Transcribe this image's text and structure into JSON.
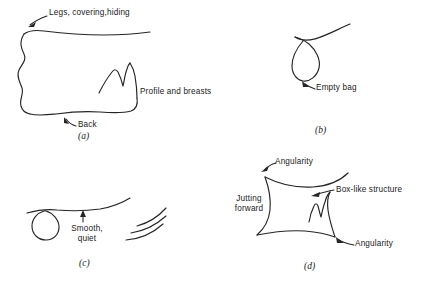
{
  "figure": {
    "background_color": "#ffffff",
    "ink_color": "#262626",
    "panels": [
      {
        "id": "a",
        "label": "(a)",
        "annotations": [
          {
            "name": "legs-covering-hiding",
            "text": "Legs, covering,hiding"
          },
          {
            "name": "profile-and-breasts",
            "text": "Profile and breasts"
          },
          {
            "name": "back",
            "text": "Back"
          }
        ]
      },
      {
        "id": "b",
        "label": "(b)",
        "annotations": [
          {
            "name": "empty-bag",
            "text": "Empty bag"
          }
        ]
      },
      {
        "id": "c",
        "label": "(c)",
        "annotations": [
          {
            "name": "smooth-quiet",
            "text": "Smooth,\nquiet",
            "line1": "Smooth,",
            "line2": "quiet"
          }
        ]
      },
      {
        "id": "d",
        "label": "(d)",
        "annotations": [
          {
            "name": "angularity-top",
            "text": "Angularity"
          },
          {
            "name": "box-like-structure",
            "text": "Box-like structure"
          },
          {
            "name": "jutting-forward",
            "text": "Jutting\nforward",
            "line1": "Jutting",
            "line2": "forward"
          },
          {
            "name": "angularity-bottom",
            "text": "Angularity"
          }
        ]
      }
    ]
  },
  "panel_a": {
    "label": "(a)",
    "legs_label": "Legs, covering,hiding",
    "profile_label": "Profile and breasts",
    "back_label": "Back"
  },
  "panel_b": {
    "label": "(b)",
    "empty_bag_label": "Empty bag"
  },
  "panel_c": {
    "label": "(c)",
    "smooth_line1": "Smooth,",
    "smooth_line2": "quiet"
  },
  "panel_d": {
    "label": "(d)",
    "angularity_top_label": "Angularity",
    "box_like_label": "Box-like structure",
    "jutting_line1": "Jutting",
    "jutting_line2": "forward",
    "angularity_bottom_label": "Angularity"
  }
}
